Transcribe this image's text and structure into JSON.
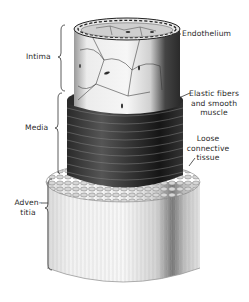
{
  "figure": {
    "layers": [
      {
        "name": "Intima",
        "label_lines": [
          "Intima"
        ]
      },
      {
        "name": "Media",
        "label_lines": [
          "Media"
        ]
      },
      {
        "name": "Adventitia",
        "label_lines": [
          "Adven-",
          "titia"
        ]
      }
    ],
    "annotations": [
      {
        "id": "endothelium",
        "lines": [
          "Endothelium"
        ]
      },
      {
        "id": "elastic",
        "lines": [
          "Elastic fibers",
          "and smooth",
          "muscle"
        ]
      },
      {
        "id": "loose",
        "lines": [
          "Loose",
          "connective",
          "tissue"
        ]
      }
    ],
    "colors": {
      "background": "#ffffff",
      "ink": "#2a2a2a",
      "intima_light": "#f0f0f0",
      "intima_shadow": "#3a3a3a",
      "media_dark": "#1c1c1c",
      "adventitia_light": "#ececec"
    }
  }
}
